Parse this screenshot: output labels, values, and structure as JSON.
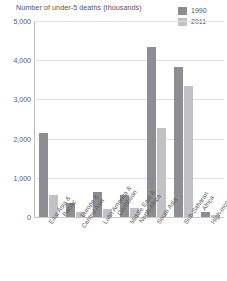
{
  "chart_data": {
    "type": "bar",
    "title": "Number of under-5 deaths (thousands)",
    "xlabel": "",
    "ylabel": "",
    "ylim": [
      0,
      5000
    ],
    "yticks": [
      0,
      1000,
      2000,
      3000,
      4000,
      5000
    ],
    "ytick_labels": [
      "0",
      "1,000",
      "2,000",
      "3,000",
      "4,000",
      "5,000"
    ],
    "grid": true,
    "legend_position": "top-right",
    "categories": [
      "East Asia & Pacific",
      "Europe & Central Asia",
      "Latin America & Caribbean",
      "Middle East & North Africa",
      "South Asia",
      "Sub-Saharan Africa",
      "High-income"
    ],
    "category_lines": [
      [
        "East Asia &",
        "Pacific"
      ],
      [
        "Europe &",
        "Central Asia"
      ],
      [
        "Latin America &",
        "Caribbean"
      ],
      [
        "Middle East &",
        "North Africa"
      ],
      [
        "South Asia"
      ],
      [
        "Sub-Saharan",
        "Africa"
      ],
      [
        "High-income"
      ]
    ],
    "series": [
      {
        "name": "1990",
        "color": "#8e8e92",
        "values": [
          2150,
          370,
          630,
          560,
          4350,
          3830,
          130
        ]
      },
      {
        "name": "2011",
        "color": "#c2c2c6",
        "values": [
          570,
          120,
          200,
          230,
          2270,
          3350,
          60
        ]
      }
    ]
  },
  "legend": {
    "items": [
      {
        "label": "1990",
        "color": "#8e8e92"
      },
      {
        "label": "2011",
        "color": "#c2c2c6"
      }
    ]
  }
}
